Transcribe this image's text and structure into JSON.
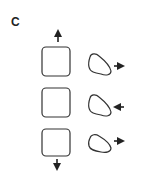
{
  "panel": {
    "label": "C",
    "rows": [
      {
        "square": "square-cell",
        "blob": "crescent-cell",
        "blob_arrow": "right"
      },
      {
        "square": "square-cell",
        "blob": "crescent-cell",
        "blob_arrow": "left"
      },
      {
        "square": "square-cell",
        "blob": "crescent-cell",
        "blob_arrow": "right"
      }
    ],
    "square_column_arrows": {
      "top": "up",
      "bottom": "down"
    },
    "colors": {
      "stroke": "#333333",
      "background": "#ffffff"
    }
  }
}
